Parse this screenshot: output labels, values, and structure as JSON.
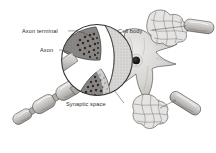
{
  "figure": {
    "type": "biological-illustration",
    "style": "grayscale pencil-shaded textbook figure",
    "background_color": "#ffffff",
    "ink_color": "#2b2b2b",
    "labels": [
      {
        "id": "axon-terminal",
        "text": "Axon terminal",
        "text_x": 22,
        "text_y": 33,
        "leader_from": [
          68,
          31
        ],
        "leader_to": [
          92,
          38
        ],
        "anchor": "start"
      },
      {
        "id": "axon",
        "text": "Axon",
        "text_x": 40,
        "text_y": 52,
        "leader_from": [
          59,
          50
        ],
        "leader_to": [
          74,
          56
        ],
        "anchor": "start"
      },
      {
        "id": "cell-body",
        "text": "Cell body",
        "text_x": 118,
        "text_y": 33,
        "leader_from": null,
        "leader_to": null,
        "anchor": "start"
      },
      {
        "id": "synaptic-space",
        "text": "Synaptic space",
        "text_x": 66,
        "text_y": 106,
        "leader_from": [
          124,
          103
        ],
        "leader_to": [
          114,
          90
        ],
        "anchor": "start"
      }
    ],
    "parts": {
      "magnifier_circle": {
        "name": "magnification-inset",
        "cx": 97,
        "cy": 60,
        "r": 36,
        "stroke": "#2f2f2f"
      },
      "cell_body": {
        "name": "soma",
        "cx": 134,
        "cy": 62,
        "fill": "#d8d6d4"
      },
      "nucleus": {
        "name": "nucleus",
        "cx": 136,
        "cy": 60,
        "r": 3.6,
        "fill": "#1c1c1c"
      },
      "terminals_in_inset": 2,
      "vesicle_count_upper": 22,
      "vesicle_count_lower": 20,
      "myelinated_axons": 3,
      "dendritic_tufts": 2
    },
    "palette": {
      "paper": "#ffffff",
      "light_gray": "#e2e0de",
      "mid_gray": "#b9b6b3",
      "dark_gray": "#8d8a87",
      "terminal_fill": "#7e7c79",
      "outline": "#3a3a3a",
      "text": "#2b2b2b"
    }
  }
}
